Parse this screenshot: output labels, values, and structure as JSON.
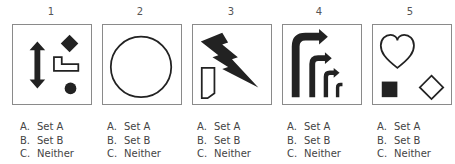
{
  "items": [
    {
      "number": "1",
      "figure": "double-arrow-diamond-lshape-dot",
      "options": [
        {
          "letter": "A.",
          "label": "Set A"
        },
        {
          "letter": "B.",
          "label": "Set B"
        },
        {
          "letter": "C.",
          "label": "Neither"
        }
      ]
    },
    {
      "number": "2",
      "figure": "circle-outline",
      "options": [
        {
          "letter": "A.",
          "label": "Set A"
        },
        {
          "letter": "B.",
          "label": "Set B"
        },
        {
          "letter": "C.",
          "label": "Neither"
        }
      ]
    },
    {
      "number": "3",
      "figure": "lightning-bolt-tag",
      "options": [
        {
          "letter": "A.",
          "label": "Set A"
        },
        {
          "letter": "B.",
          "label": "Set B"
        },
        {
          "letter": "C.",
          "label": "Neither"
        }
      ]
    },
    {
      "number": "4",
      "figure": "nested-right-turn-arrows",
      "options": [
        {
          "letter": "A.",
          "label": "Set A"
        },
        {
          "letter": "B.",
          "label": "Set B"
        },
        {
          "letter": "C.",
          "label": "Neither"
        }
      ]
    },
    {
      "number": "5",
      "figure": "heart-square-diamond",
      "options": [
        {
          "letter": "A.",
          "label": "Set A"
        },
        {
          "letter": "B.",
          "label": "Set B"
        },
        {
          "letter": "C.",
          "label": "Neither"
        }
      ]
    }
  ]
}
